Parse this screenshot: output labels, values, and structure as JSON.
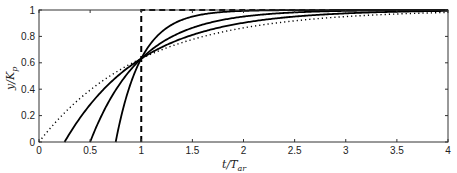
{
  "chart_data": {
    "type": "line",
    "title": "",
    "xlabel": "t/T_ar",
    "ylabel": "y/K_p",
    "xlim": [
      0,
      4
    ],
    "ylim": [
      0,
      1
    ],
    "grid": false,
    "legend": null,
    "x_ticks": [
      "0",
      "0.5",
      "1",
      "1.5",
      "2",
      "2.5",
      "3",
      "3.5",
      "4"
    ],
    "y_ticks": [
      "0",
      "0.2",
      "0.4",
      "0.6",
      "0.8",
      "1"
    ],
    "series": [
      {
        "name": "L=0, T=1",
        "style": "dotted",
        "dead_time": 0.0,
        "time_constant": 1.0
      },
      {
        "name": "L=0.25, T=0.75",
        "style": "solid",
        "dead_time": 0.25,
        "time_constant": 0.75
      },
      {
        "name": "L=0.5, T=0.5",
        "style": "solid",
        "dead_time": 0.5,
        "time_constant": 0.5
      },
      {
        "name": "L=0.75, T=0.25",
        "style": "solid",
        "dead_time": 0.75,
        "time_constant": 0.25
      },
      {
        "name": "L=1, T=0 (pure delay)",
        "style": "dashed",
        "dead_time": 1.0,
        "time_constant": 0.0
      }
    ],
    "annotations": [
      {
        "x": 1,
        "y": 0.632,
        "text": "common intersection point"
      }
    ]
  },
  "labels": {
    "xlabel_main": "t/T",
    "xlabel_sub": "ar",
    "ylabel_main": "y/K",
    "ylabel_sub": "p"
  }
}
